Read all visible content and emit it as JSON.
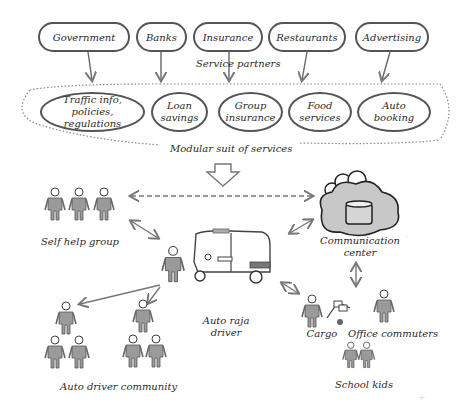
{
  "diagram": {
    "service_partners": {
      "caption": "Service partners",
      "items": [
        "Government",
        "Banks",
        "Insurance",
        "Restaurants",
        "Advertising"
      ]
    },
    "modular_services": {
      "caption": "Modular suit of services",
      "items": [
        {
          "line1": "Traffic info,",
          "line2": "policies, regulations"
        },
        {
          "line1": "Loan",
          "line2": "savings"
        },
        {
          "line1": "Group",
          "line2": "insurance"
        },
        {
          "line1": "Food",
          "line2": "services"
        },
        {
          "line1": "Auto",
          "line2": "booking"
        }
      ]
    },
    "nodes": {
      "self_help_group": "Self help group",
      "communication_center_line1": "Communication",
      "communication_center_line2": "center",
      "auto_raja_driver_line1": "Auto raja",
      "auto_raja_driver_line2": "driver",
      "auto_driver_community": "Auto driver community",
      "cargo": "Cargo",
      "office_commuters": "Office commuters",
      "school_kids": "School kids"
    },
    "colors": {
      "stroke": "#555555",
      "arrow": "#777777",
      "cloud_fill": "#c8c8c8",
      "figure_fill": "#9a9a9a"
    }
  }
}
